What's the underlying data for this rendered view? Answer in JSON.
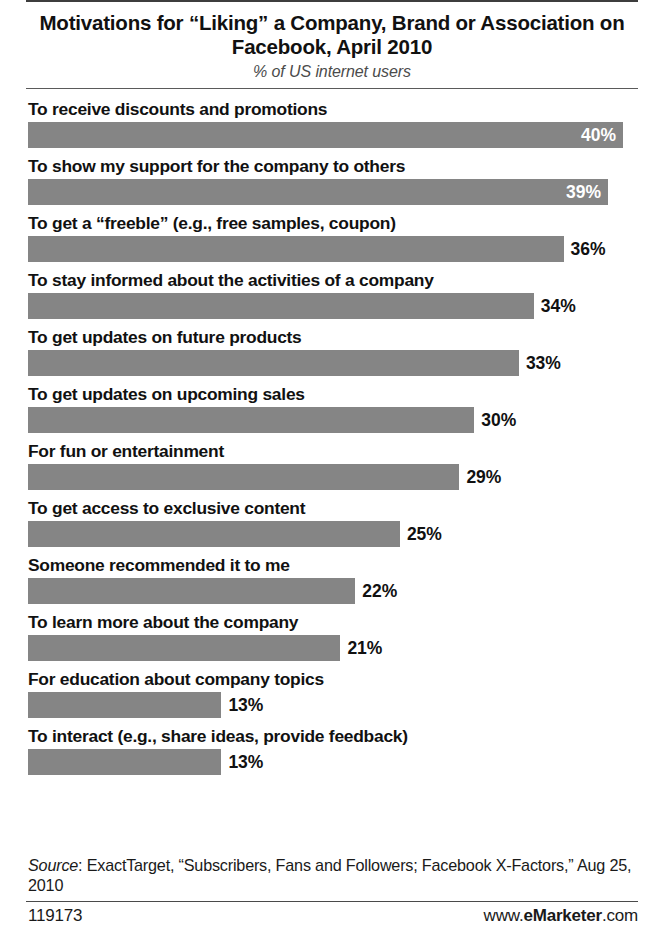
{
  "header": {
    "title": "Motivations for “Liking” a Company, Brand or Association on Facebook, April 2010",
    "subtitle": "% of US internet users"
  },
  "footer": {
    "source": "Source: ExactTarget, “Subscribers, Fans and Followers; Facebook X-Factors,” Aug 25, 2010",
    "source_label": "Source",
    "source_rest": ": ExactTarget, “Subscribers, Fans and Followers; Facebook X-Factors,” Aug 25, 2010",
    "id_number": "119173",
    "brand_prefix": "www.",
    "brand_name": "eMarketer",
    "brand_suffix": ".com"
  },
  "chart_data": {
    "type": "bar",
    "orientation": "horizontal",
    "title": "Motivations for “Liking” a Company, Brand or Association on Facebook, April 2010",
    "subtitle": "% of US internet users",
    "xlabel": "",
    "ylabel": "",
    "unit": "%",
    "grid": false,
    "legend": false,
    "xlim": [
      0,
      40
    ],
    "bar_color": "#858585",
    "categories": [
      "To receive discounts and promotions",
      "To show my support for the company to others",
      "To get a “freeble” (e.g., free samples, coupon)",
      "To stay informed about the activities of a company",
      "To get updates on future products",
      "To get updates on upcoming sales",
      "For fun or entertainment",
      "To get access to exclusive content",
      "Someone recommended it to me",
      "To learn more about the company",
      "For education about company topics",
      "To interact (e.g., share ideas, provide feedback)"
    ],
    "values": [
      40,
      39,
      36,
      34,
      33,
      30,
      29,
      25,
      22,
      21,
      13,
      13
    ],
    "value_labels": [
      "40%",
      "39%",
      "36%",
      "34%",
      "33%",
      "30%",
      "29%",
      "25%",
      "22%",
      "21%",
      "13%",
      "13%"
    ],
    "label_placement": [
      "inside",
      "inside",
      "outside",
      "outside",
      "outside",
      "outside",
      "outside",
      "outside",
      "outside",
      "outside",
      "outside",
      "outside"
    ]
  }
}
